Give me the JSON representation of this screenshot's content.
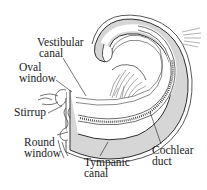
{
  "figure": {
    "labels": {
      "vestibular_canal": {
        "line1": "Vestibular",
        "line2": "canal"
      },
      "oval_window": {
        "line1": "Oval",
        "line2": "window"
      },
      "stirrup": {
        "line1": "Stirrup"
      },
      "round_window": {
        "line1": "Round",
        "line2": "window"
      },
      "tympanic_canal": {
        "line1": "Tympanic",
        "line2": "canal"
      },
      "cochlear_duct": {
        "line1": "Cochlear",
        "line2": "duct"
      }
    },
    "colors": {
      "canal_fill": "#d4d4d4",
      "outline": "#3a3a3a",
      "background": "#ffffff",
      "text": "#1a1a1a"
    }
  }
}
